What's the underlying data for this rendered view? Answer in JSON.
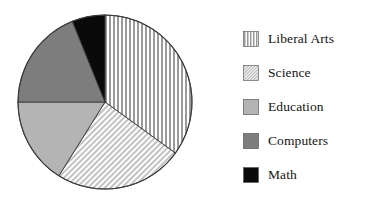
{
  "chart_data": {
    "type": "pie",
    "title": "",
    "legend_position": "right",
    "categories": [
      "Liberal Arts",
      "Science",
      "Education",
      "Computers",
      "Math"
    ],
    "values": [
      35,
      24,
      16,
      19,
      6
    ],
    "units": "percent",
    "start_angle_deg": 0,
    "direction": "clockwise",
    "slices": [
      {
        "label": "Liberal Arts",
        "value": 35,
        "start_angle_deg": 0,
        "end_angle_deg": 126,
        "pattern": "vertical-stripes",
        "fill": "#ffffff",
        "stripe_color": "#9a9a9a"
      },
      {
        "label": "Science",
        "value": 24,
        "start_angle_deg": 126,
        "end_angle_deg": 212,
        "pattern": "diagonal-stripes",
        "fill": "#ffffff",
        "stripe_color": "#c8c8c8"
      },
      {
        "label": "Education",
        "value": 16,
        "start_angle_deg": 212,
        "end_angle_deg": 270,
        "pattern": "solid",
        "fill": "#b4b4b4",
        "stripe_color": ""
      },
      {
        "label": "Computers",
        "value": 19,
        "start_angle_deg": 270,
        "end_angle_deg": 338,
        "pattern": "solid",
        "fill": "#7d7d7d",
        "stripe_color": ""
      },
      {
        "label": "Math",
        "value": 6,
        "start_angle_deg": 338,
        "end_angle_deg": 360,
        "pattern": "solid",
        "fill": "#0a0a0a",
        "stripe_color": ""
      }
    ],
    "geometry": {
      "center_x": 88,
      "center_y": 88,
      "radius": 87
    },
    "background": "#ffffff"
  },
  "legend": {
    "items": [
      {
        "label": "Liberal Arts",
        "swatch": "vertical-stripes-swatch"
      },
      {
        "label": "Science",
        "swatch": "diagonal-stripes-swatch"
      },
      {
        "label": "Education",
        "swatch": "light-gray-swatch"
      },
      {
        "label": "Computers",
        "swatch": "dark-gray-swatch"
      },
      {
        "label": "Math",
        "swatch": "black-swatch"
      }
    ]
  }
}
